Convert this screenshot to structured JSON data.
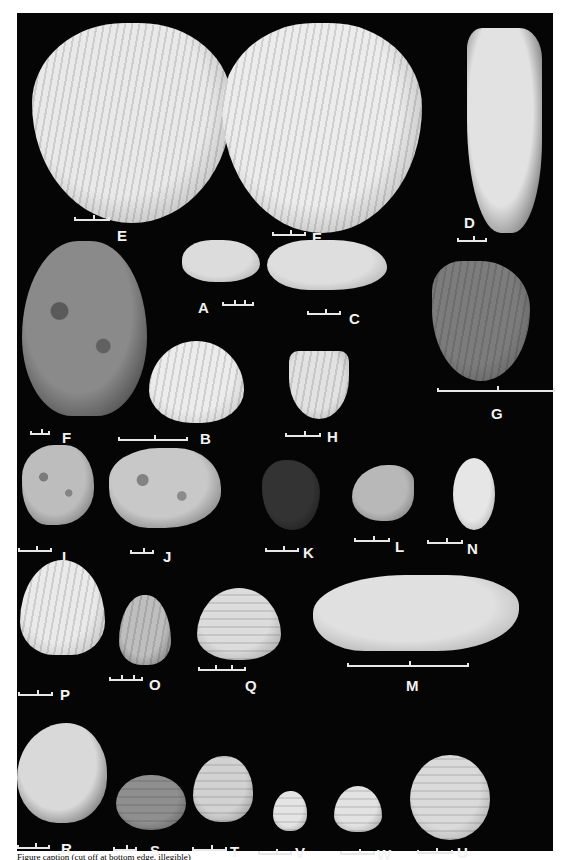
{
  "figure": {
    "background": "#050505",
    "caption_visible": "Figure caption (cut off at bottom edge, illegible)",
    "specimens": [
      {
        "id": "E1",
        "label": "E",
        "shell": {
          "x": 15,
          "y": 10,
          "w": 200,
          "h": 200,
          "shape": "scallop-inner",
          "fill": "#e9e9e9",
          "edge": "#9a9a9a"
        },
        "bar": {
          "x": 57,
          "y": 204,
          "w": 36,
          "ticks": 1
        },
        "text": {
          "x": 100,
          "y": 215
        }
      },
      {
        "id": "E2",
        "label": "E",
        "shell": {
          "x": 205,
          "y": 10,
          "w": 200,
          "h": 210,
          "shape": "scallop-inner",
          "fill": "#ececec",
          "edge": "#9a9a9a"
        },
        "bar": {
          "x": 255,
          "y": 219,
          "w": 34,
          "ticks": 1
        },
        "text": {
          "x": 295,
          "y": 217
        }
      },
      {
        "id": "D",
        "label": "D",
        "shell": {
          "x": 450,
          "y": 15,
          "w": 75,
          "h": 205,
          "shape": "elongate",
          "fill": "#e2e2e2",
          "edge": "#3a3a3a"
        },
        "bar": {
          "x": 440,
          "y": 225,
          "w": 30,
          "ticks": 1
        },
        "text": {
          "x": 447,
          "y": 202
        }
      },
      {
        "id": "F",
        "label": "F",
        "shell": {
          "x": 5,
          "y": 228,
          "w": 125,
          "h": 175,
          "shape": "oyster",
          "fill": "#8a8a8a",
          "edge": "#2a2a2a"
        },
        "bar": {
          "x": 13,
          "y": 418,
          "w": 20,
          "ticks": 1
        },
        "text": {
          "x": 45,
          "y": 417
        }
      },
      {
        "id": "A",
        "label": "A",
        "shell": {
          "x": 165,
          "y": 227,
          "w": 78,
          "h": 42,
          "shape": "ark",
          "fill": "#dcdcdc",
          "edge": "#a0a0a0"
        },
        "bar": {
          "x": 205,
          "y": 289,
          "w": 32,
          "ticks": 2
        },
        "text": {
          "x": 181,
          "y": 287
        }
      },
      {
        "id": "C",
        "label": "C",
        "shell": {
          "x": 250,
          "y": 227,
          "w": 120,
          "h": 50,
          "shape": "ark-long",
          "fill": "#dedede",
          "edge": "#a0a0a0"
        },
        "bar": {
          "x": 290,
          "y": 298,
          "w": 34,
          "ticks": 1
        },
        "text": {
          "x": 332,
          "y": 298
        }
      },
      {
        "id": "G",
        "label": "G",
        "shell": {
          "x": 415,
          "y": 248,
          "w": 98,
          "h": 120,
          "shape": "scallop-ribbed",
          "fill": "#7c7c7c",
          "edge": "#555555"
        },
        "bar": {
          "x": 420,
          "y": 375,
          "w": 118,
          "ticks": 1
        },
        "text": {
          "x": 474,
          "y": 393
        }
      },
      {
        "id": "B",
        "label": "B",
        "shell": {
          "x": 132,
          "y": 328,
          "w": 95,
          "h": 82,
          "shape": "cockle",
          "fill": "#ececec",
          "edge": "#bdbdbd"
        },
        "bar": {
          "x": 101,
          "y": 424,
          "w": 70,
          "ticks": 1
        },
        "text": {
          "x": 183,
          "y": 418
        }
      },
      {
        "id": "H",
        "label": "H",
        "shell": {
          "x": 272,
          "y": 338,
          "w": 60,
          "h": 68,
          "shape": "scallop-small",
          "fill": "#e2e2e2",
          "edge": "#aaaaaa"
        },
        "bar": {
          "x": 268,
          "y": 420,
          "w": 36,
          "ticks": 1
        },
        "text": {
          "x": 310,
          "y": 416
        }
      },
      {
        "id": "I",
        "label": "I",
        "shell": {
          "x": 5,
          "y": 432,
          "w": 72,
          "h": 80,
          "shape": "coral",
          "fill": "#bdbdbd",
          "edge": "#5a5a5a"
        },
        "bar": {
          "x": 1,
          "y": 535,
          "w": 34,
          "ticks": 1
        },
        "text": {
          "x": 45,
          "y": 536
        }
      },
      {
        "id": "J",
        "label": "J",
        "shell": {
          "x": 92,
          "y": 435,
          "w": 112,
          "h": 80,
          "shape": "coral",
          "fill": "#c8c8c8",
          "edge": "#5a5a5a"
        },
        "bar": {
          "x": 113,
          "y": 537,
          "w": 24,
          "ticks": 1
        },
        "text": {
          "x": 146,
          "y": 536
        }
      },
      {
        "id": "K",
        "label": "K",
        "shell": {
          "x": 245,
          "y": 447,
          "w": 58,
          "h": 70,
          "shape": "mussel",
          "fill": "#333333",
          "edge": "#151515"
        },
        "bar": {
          "x": 248,
          "y": 535,
          "w": 34,
          "ticks": 1
        },
        "text": {
          "x": 286,
          "y": 532
        }
      },
      {
        "id": "L",
        "label": "L",
        "shell": {
          "x": 335,
          "y": 452,
          "w": 62,
          "h": 56,
          "shape": "mussel-light",
          "fill": "#b8b8b8",
          "edge": "#6a6a6a"
        },
        "bar": {
          "x": 337,
          "y": 525,
          "w": 36,
          "ticks": 1
        },
        "text": {
          "x": 378,
          "y": 526
        }
      },
      {
        "id": "N",
        "label": "N",
        "shell": {
          "x": 436,
          "y": 445,
          "w": 42,
          "h": 72,
          "shape": "lens",
          "fill": "#e6e6e6",
          "edge": "#9a9a9a"
        },
        "bar": {
          "x": 410,
          "y": 527,
          "w": 36,
          "ticks": 1
        },
        "text": {
          "x": 450,
          "y": 528
        }
      },
      {
        "id": "P",
        "label": "P",
        "shell": {
          "x": 3,
          "y": 547,
          "w": 85,
          "h": 95,
          "shape": "cockle-tall",
          "fill": "#eaeaea",
          "edge": "#b5b5b5"
        },
        "bar": {
          "x": 1,
          "y": 679,
          "w": 35,
          "ticks": 1
        },
        "text": {
          "x": 43,
          "y": 674
        }
      },
      {
        "id": "O",
        "label": "O",
        "shell": {
          "x": 102,
          "y": 582,
          "w": 52,
          "h": 70,
          "shape": "cockle-ribbed",
          "fill": "#bebebe",
          "edge": "#6a6a6a"
        },
        "bar": {
          "x": 92,
          "y": 664,
          "w": 34,
          "ticks": 2
        },
        "text": {
          "x": 132,
          "y": 664
        }
      },
      {
        "id": "Q",
        "label": "Q",
        "shell": {
          "x": 180,
          "y": 575,
          "w": 84,
          "h": 72,
          "shape": "venus",
          "fill": "#dcdcdc",
          "edge": "#9a9a9a"
        },
        "bar": {
          "x": 181,
          "y": 654,
          "w": 48,
          "ticks": 2
        },
        "text": {
          "x": 228,
          "y": 665
        }
      },
      {
        "id": "M",
        "label": "M",
        "shell": {
          "x": 296,
          "y": 562,
          "w": 206,
          "h": 76,
          "shape": "razor",
          "fill": "#e0e0e0",
          "edge": "#a0a0a0"
        },
        "bar": {
          "x": 330,
          "y": 650,
          "w": 122,
          "ticks": 1
        },
        "text": {
          "x": 389,
          "y": 665
        }
      },
      {
        "id": "R",
        "label": "R",
        "shell": {
          "x": 0,
          "y": 710,
          "w": 90,
          "h": 100,
          "shape": "zigzag",
          "fill": "#d9d9d9",
          "edge": "#3a3a3a"
        },
        "bar": {
          "x": 0,
          "y": 832,
          "w": 33,
          "ticks": 1
        },
        "text": {
          "x": 44,
          "y": 828
        }
      },
      {
        "id": "S",
        "label": "S",
        "shell": {
          "x": 99,
          "y": 762,
          "w": 70,
          "h": 55,
          "shape": "oval",
          "fill": "#8f8f8f",
          "edge": "#5a5a5a"
        },
        "bar": {
          "x": 96,
          "y": 834,
          "w": 24,
          "ticks": 1
        },
        "text": {
          "x": 133,
          "y": 830
        }
      },
      {
        "id": "T",
        "label": "T",
        "shell": {
          "x": 176,
          "y": 743,
          "w": 60,
          "h": 66,
          "shape": "venus-tall",
          "fill": "#d2d2d2",
          "edge": "#8a8a8a"
        },
        "bar": {
          "x": 175,
          "y": 834,
          "w": 35,
          "ticks": 1
        },
        "text": {
          "x": 213,
          "y": 831
        }
      },
      {
        "id": "V",
        "label": "V",
        "shell": {
          "x": 256,
          "y": 778,
          "w": 34,
          "h": 40,
          "shape": "venus-tall",
          "fill": "#e4e4e4",
          "edge": "#9a9a9a"
        },
        "bar": {
          "x": 241,
          "y": 838,
          "w": 34,
          "ticks": 1
        },
        "text": {
          "x": 278,
          "y": 832
        }
      },
      {
        "id": "W",
        "label": "W",
        "shell": {
          "x": 317,
          "y": 773,
          "w": 48,
          "h": 46,
          "shape": "venus",
          "fill": "#e2e2e2",
          "edge": "#9a9a9a"
        },
        "bar": {
          "x": 323,
          "y": 838,
          "w": 35,
          "ticks": 1
        },
        "text": {
          "x": 360,
          "y": 834
        }
      },
      {
        "id": "U",
        "label": "U",
        "shell": {
          "x": 393,
          "y": 742,
          "w": 80,
          "h": 85,
          "shape": "round",
          "fill": "#dadada",
          "edge": "#9a9a9a"
        },
        "bar": {
          "x": 400,
          "y": 837,
          "w": 36,
          "ticks": 1
        },
        "text": {
          "x": 440,
          "y": 832
        }
      }
    ]
  }
}
